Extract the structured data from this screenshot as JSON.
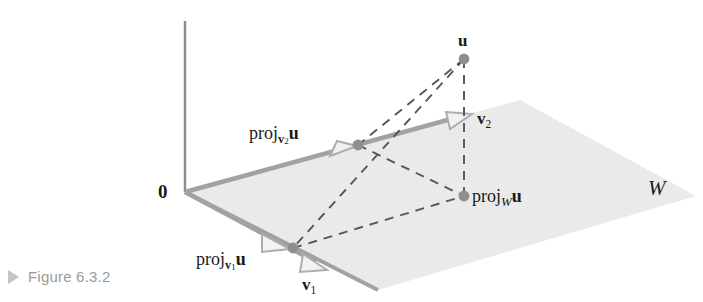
{
  "figure": {
    "caption_marker": "triangle-right-marker",
    "caption_text": "Figure 6.3.2"
  },
  "diagram": {
    "origin_label": "0",
    "subspace_label": "W",
    "vector_u_label": "u",
    "vector_v1_label": "v",
    "vector_v1_sub": "1",
    "vector_v2_label": "v",
    "vector_v2_sub": "2",
    "proj_v1_prefix": "proj",
    "proj_v1_sub": "v",
    "proj_v1_sub_index": "1",
    "proj_v1_arg": "u",
    "proj_v2_prefix": "proj",
    "proj_v2_sub": "v",
    "proj_v2_sub_index": "2",
    "proj_v2_arg": "u",
    "proj_w_prefix": "proj",
    "proj_w_sub": "W",
    "proj_w_arg": "u",
    "colors": {
      "plane_fill": "#e8e8e8",
      "vector_gray": "#9b9b9b",
      "dot_gray": "#8f8f8f",
      "dashed_line": "#4a4a4a",
      "axis_gray": "#8a8a8a",
      "text_black": "#1a1a1a",
      "caption_gray": "#999a9c"
    },
    "points": {
      "origin": [
        185,
        192
      ],
      "u": [
        464,
        59
      ],
      "proj_w_u": [
        464,
        196
      ],
      "proj_v1_u": [
        293,
        248
      ],
      "proj_v2_u": [
        358,
        145
      ],
      "v1_tip": [
        318,
        265
      ],
      "v2_tip": [
        466,
        118
      ],
      "axis_top": [
        185,
        21
      ],
      "plane_top_corner": [
        520,
        100
      ],
      "plane_right_corner": [
        696,
        196
      ],
      "plane_bottom_corner": [
        378,
        290
      ]
    }
  }
}
